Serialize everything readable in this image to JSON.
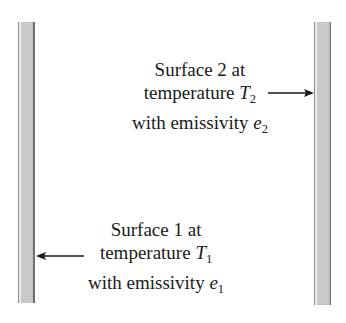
{
  "figure": {
    "name": "two-parallel-surfaces-radiation-diagram",
    "background_color": "#ffffff",
    "text_color": "#1a1a1a"
  },
  "plates": [
    {
      "id": "plate-left",
      "label": "surface-1-plate",
      "fill_color": "#cdcdcd",
      "edge_color": "#6f6f6f"
    },
    {
      "id": "plate-right",
      "label": "surface-2-plate",
      "fill_color": "#cdcdcd",
      "edge_color": "#6f6f6f"
    }
  ],
  "captions": {
    "surface2": {
      "line1": "Surface 2 at",
      "line2_prefix": "temperature ",
      "line2_var": "T",
      "line2_sub": "2",
      "line3_prefix": "with emissivity ",
      "line3_var": "e",
      "line3_sub": "2"
    },
    "surface1": {
      "line1": "Surface 1 at",
      "line2_prefix": "temperature ",
      "line2_var": "T",
      "line2_sub": "1",
      "line3_prefix": "with emissivity ",
      "line3_var": "e",
      "line3_sub": "1"
    }
  },
  "arrows": {
    "to_surface2": {
      "direction": "right",
      "points_to": "plate-right"
    },
    "to_surface1": {
      "direction": "left",
      "points_to": "plate-left"
    }
  }
}
